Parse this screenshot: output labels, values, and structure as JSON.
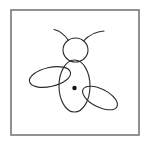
{
  "image": {
    "title": "Insect line drawing",
    "subject": "bee-or-fly-figure",
    "width": 150,
    "height": 144,
    "background_color": "#ffffff"
  },
  "frame": {
    "name": "picture-border",
    "x": 11,
    "y": 10,
    "width": 128,
    "height": 125,
    "stroke_color": "#777777",
    "stroke_width": 1.6,
    "fill_color": "#ffffff"
  },
  "drawing": {
    "stroke_color": "#2b2b2b",
    "stroke_width": 1.1,
    "fill_color": "none",
    "parts": [
      {
        "name": "head",
        "shape": "ellipse",
        "cx": 75.5,
        "cy": 50,
        "rx": 12.5,
        "ry": 12,
        "rotate": 0
      },
      {
        "name": "body",
        "shape": "ellipse",
        "cx": 74.5,
        "cy": 86,
        "rx": 15.5,
        "ry": 26,
        "rotate": 0
      },
      {
        "name": "left-wing",
        "shape": "ellipse",
        "cx": 50,
        "cy": 77,
        "rx": 21,
        "ry": 9.5,
        "rotate": -13
      },
      {
        "name": "right-wing",
        "shape": "ellipse",
        "cx": 100,
        "cy": 98,
        "rx": 19,
        "ry": 9,
        "rotate": 27
      },
      {
        "name": "body-center-dot",
        "shape": "circle",
        "cx": 74.5,
        "cy": 88,
        "r": 2.2,
        "fill_color": "#111111"
      }
    ],
    "antennae": [
      {
        "name": "left-antenna",
        "shape": "path",
        "d": "M 68.5 40.5 C 64 34 60 30.5 54 29.5"
      },
      {
        "name": "right-antenna",
        "shape": "path",
        "d": "M 83.5 41 C 89 35 96 31.5 104 31"
      }
    ]
  }
}
